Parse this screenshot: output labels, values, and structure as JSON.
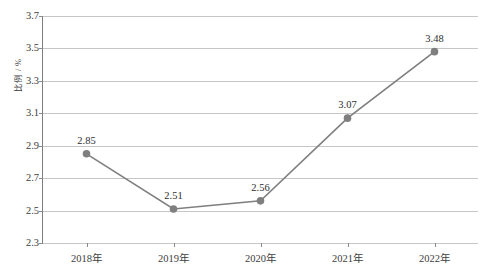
{
  "chart_data": {
    "type": "line",
    "title": "",
    "subtitle": "",
    "xlabel": "",
    "ylabel": "比例 / %",
    "categories": [
      "2018年",
      "2019年",
      "2020年",
      "2021年",
      "2022年"
    ],
    "values": [
      2.85,
      2.51,
      2.56,
      3.07,
      3.48
    ],
    "data_labels": [
      "2.85",
      "2.51",
      "2.56",
      "3.07",
      "3.48"
    ],
    "series": [
      {
        "name": "比例",
        "values": [
          2.85,
          2.51,
          2.56,
          3.07,
          3.48
        ]
      }
    ],
    "ylim": [
      2.3,
      3.7
    ],
    "ytick_labels": [
      "3.7",
      "3.5",
      "3.3",
      "3.1",
      "2.9",
      "2.7",
      "2.5",
      "2.3"
    ],
    "ytick_values": [
      3.7,
      3.5,
      3.3,
      3.1,
      2.9,
      2.7,
      2.5,
      2.3
    ],
    "ytick_step": 0.2,
    "grid": "horizontal",
    "legend": "none",
    "legend_position": "",
    "annotations": []
  },
  "style": {
    "line_color": "#7f7f7f",
    "marker_color": "#7f7f7f",
    "gridline_color": "#c6c6c6",
    "axis_color": "#7d7d7d",
    "text_color": "#3d3d3d",
    "background": "#ffffff"
  }
}
